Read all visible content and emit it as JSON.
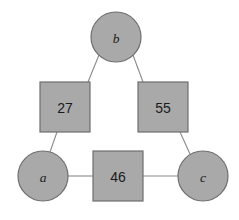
{
  "diagram": {
    "type": "weighted-graph",
    "title": "",
    "background_color": "#ffffff",
    "shape_fill_color": "#a9a9a9",
    "shape_stroke_color": "#6e6e6e",
    "edge_line_color": "#8a8a8a",
    "label_color": "#1a1a1a",
    "nodes": [
      {
        "id": "b",
        "label": "b",
        "shape": "circle",
        "cx": 116,
        "cy": 37,
        "r": 25
      },
      {
        "id": "a",
        "label": "a",
        "shape": "circle",
        "cx": 43,
        "cy": 176,
        "r": 25
      },
      {
        "id": "c",
        "label": "c",
        "shape": "circle",
        "cx": 203,
        "cy": 176,
        "r": 25
      }
    ],
    "weights": [
      {
        "id": "w-ab",
        "label": "27",
        "shape": "square",
        "x": 40,
        "y": 82,
        "size": 50,
        "connects": [
          "a",
          "b"
        ]
      },
      {
        "id": "w-bc",
        "label": "55",
        "shape": "square",
        "x": 138,
        "y": 82,
        "size": 50,
        "connects": [
          "b",
          "c"
        ]
      },
      {
        "id": "w-ac",
        "label": "46",
        "shape": "square",
        "x": 93,
        "y": 151,
        "size": 50,
        "connects": [
          "a",
          "c"
        ]
      }
    ],
    "edges": [
      {
        "id": "edge-b-27",
        "from": "b",
        "to": "w-ab",
        "x1": 99,
        "y1": 55,
        "x2": 88,
        "y2": 82
      },
      {
        "id": "edge-27-a",
        "from": "w-ab",
        "to": "a",
        "x1": 57,
        "y1": 132,
        "x2": 50,
        "y2": 152
      },
      {
        "id": "edge-b-55",
        "from": "b",
        "to": "w-bc",
        "x1": 133,
        "y1": 55,
        "x2": 143,
        "y2": 82
      },
      {
        "id": "edge-55-c",
        "from": "w-bc",
        "to": "c",
        "x1": 180,
        "y1": 132,
        "x2": 190,
        "y2": 154
      },
      {
        "id": "edge-a-46",
        "from": "a",
        "to": "w-ac",
        "x1": 68,
        "y1": 176,
        "x2": 93,
        "y2": 176
      },
      {
        "id": "edge-46-c",
        "from": "w-ac",
        "to": "c",
        "x1": 143,
        "y1": 176,
        "x2": 178,
        "y2": 176
      }
    ]
  }
}
